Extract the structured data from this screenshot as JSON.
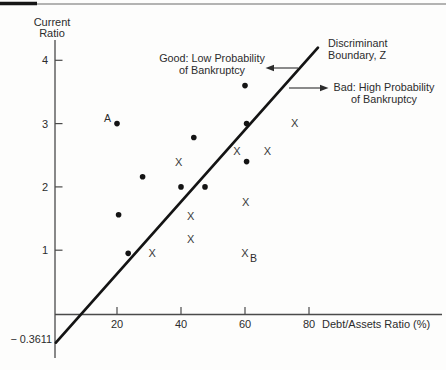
{
  "figure": {
    "y_axis_title_line1": "Current",
    "y_axis_title_line2": "Ratio",
    "x_axis_title": "Debt/Assets Ratio (%)",
    "y_intercept_label": "− 0.3611",
    "annotations": {
      "good_line1": "Good: Low Probability",
      "good_line2": "of Bankruptcy",
      "bad_line1": "Bad: High Probability",
      "bad_line2": "of Bankruptcy",
      "boundary_line1": "Discriminant",
      "boundary_line2": "Boundary, Z"
    },
    "colors": {
      "ink": "#2c2c2c",
      "plot_line": "#141414",
      "axis": "#4a4a4a",
      "top_rule_gray": "#9a9a9a",
      "top_rule_black": "#161616"
    }
  },
  "chart_data": {
    "type": "scatter",
    "xlabel": "Debt/Assets Ratio (%)",
    "ylabel": "Current Ratio",
    "x_ticks": [
      20,
      40,
      60,
      80
    ],
    "y_ticks": [
      1,
      2,
      3,
      4
    ],
    "xlim": [
      0,
      122
    ],
    "ylim": [
      -0.65,
      4.3
    ],
    "grid": false,
    "legend_position": "none",
    "series": [
      {
        "name": "Good: Low Probability of Bankruptcy",
        "marker": "dot",
        "points": [
          [
            20,
            3.0
          ],
          [
            60,
            3.6
          ],
          [
            44,
            2.78
          ],
          [
            60.5,
            3.0
          ],
          [
            60.5,
            2.4
          ],
          [
            28,
            2.16
          ],
          [
            40,
            2.0
          ],
          [
            47.5,
            2.0
          ],
          [
            20.5,
            1.56
          ],
          [
            23.5,
            0.95
          ]
        ]
      },
      {
        "name": "Bad: High Probability of Bankruptcy",
        "marker": "x",
        "points": [
          [
            75.5,
            3.0
          ],
          [
            57.5,
            2.56
          ],
          [
            67,
            2.56
          ],
          [
            39.3,
            2.39
          ],
          [
            60.2,
            1.76
          ],
          [
            43,
            1.54
          ],
          [
            43,
            1.17
          ],
          [
            31,
            0.96
          ],
          [
            60,
            0.95
          ]
        ]
      }
    ],
    "labeled_points": [
      {
        "label": "A",
        "series": "dot",
        "x": 20,
        "y": 3.0
      },
      {
        "label": "B",
        "series": "x",
        "x": 60,
        "y": 0.95
      }
    ],
    "boundary_line": {
      "label": "Discriminant Boundary, Z",
      "y_intercept_shown": "−0.3611",
      "x1": 0.9,
      "y1": -0.46,
      "x2": 82.8,
      "y2": 4.2
    }
  }
}
